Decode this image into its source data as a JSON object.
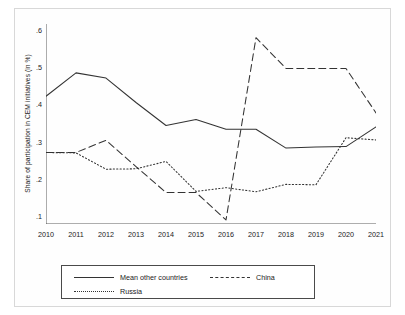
{
  "chart_data": {
    "type": "line",
    "title": "",
    "xlabel": "",
    "ylabel": "Share of participation in CEM initiatives (in %)",
    "categories": [
      "2010",
      "2011",
      "2012",
      "2013",
      "2014",
      "2015",
      "2016",
      "2017",
      "2018",
      "2019",
      "2020",
      "2021"
    ],
    "x": [
      2010,
      2011,
      2012,
      2013,
      2014,
      2015,
      2016,
      2017,
      2018,
      2019,
      2020,
      2021
    ],
    "xlim": [
      2010,
      2021
    ],
    "ylim": [
      0.08,
      0.62
    ],
    "yticks": [
      0.1,
      0.2,
      0.3,
      0.4,
      0.5,
      0.6
    ],
    "ytick_labels": [
      ".1",
      ".2",
      ".3",
      ".4",
      ".5",
      ".6"
    ],
    "grid": false,
    "legend_position": "bottom",
    "series": [
      {
        "name": "Mean other countries",
        "style": "solid",
        "color": "#333333",
        "values": [
          0.425,
          0.488,
          0.474,
          0.408,
          0.346,
          0.362,
          0.336,
          0.336,
          0.285,
          0.288,
          0.289,
          0.342
        ]
      },
      {
        "name": "China",
        "style": "dashed",
        "color": "#333333",
        "values": [
          0.273,
          0.273,
          0.306,
          0.235,
          0.165,
          0.165,
          0.091,
          0.583,
          0.5,
          0.5,
          0.5,
          0.38
        ]
      },
      {
        "name": "Russia",
        "style": "dotted",
        "color": "#333333",
        "values": [
          0.273,
          0.272,
          0.228,
          0.229,
          0.249,
          0.168,
          0.178,
          0.167,
          0.187,
          0.186,
          0.313,
          0.307
        ]
      }
    ]
  },
  "legend": {
    "entries": [
      {
        "label": "Mean other countries",
        "style": "solid"
      },
      {
        "label": "China",
        "style": "dashed"
      },
      {
        "label": "Russia",
        "style": "dotted"
      }
    ]
  }
}
